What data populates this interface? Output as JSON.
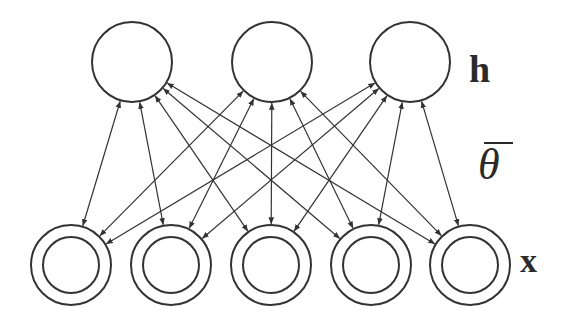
{
  "diagram": {
    "labels": {
      "hidden_layer": "h",
      "visible_layer": "x",
      "parameters": "θ"
    },
    "colors": {
      "stroke": "#333333",
      "background": "#ffffff"
    },
    "hidden_nodes": [
      {
        "id": "h1",
        "cx": 132,
        "cy": 62,
        "r": 40
      },
      {
        "id": "h2",
        "cx": 272,
        "cy": 62,
        "r": 40
      },
      {
        "id": "h3",
        "cx": 410,
        "cy": 62,
        "r": 40
      }
    ],
    "visible_nodes": [
      {
        "id": "x1",
        "cx": 71,
        "cy": 265,
        "r_outer": 40,
        "r_inner": 28
      },
      {
        "id": "x2",
        "cx": 171,
        "cy": 265,
        "r_outer": 40,
        "r_inner": 28
      },
      {
        "id": "x3",
        "cx": 271,
        "cy": 265,
        "r_outer": 40,
        "r_inner": 28
      },
      {
        "id": "x4",
        "cx": 371,
        "cy": 265,
        "r_outer": 40,
        "r_inner": 28
      },
      {
        "id": "x5",
        "cx": 470,
        "cy": 265,
        "r_outer": 40,
        "r_inner": 28
      }
    ],
    "edges": [
      {
        "from": "h1",
        "to": "x1",
        "type": "bidirectional"
      },
      {
        "from": "h1",
        "to": "x2",
        "type": "bidirectional"
      },
      {
        "from": "h1",
        "to": "x3",
        "type": "bidirectional"
      },
      {
        "from": "h1",
        "to": "x4",
        "type": "bidirectional"
      },
      {
        "from": "h1",
        "to": "x5",
        "type": "bidirectional"
      },
      {
        "from": "h2",
        "to": "x1",
        "type": "bidirectional"
      },
      {
        "from": "h2",
        "to": "x2",
        "type": "bidirectional"
      },
      {
        "from": "h2",
        "to": "x3",
        "type": "bidirectional"
      },
      {
        "from": "h2",
        "to": "x4",
        "type": "bidirectional"
      },
      {
        "from": "h2",
        "to": "x5",
        "type": "bidirectional"
      },
      {
        "from": "h3",
        "to": "x1",
        "type": "bidirectional"
      },
      {
        "from": "h3",
        "to": "x2",
        "type": "bidirectional"
      },
      {
        "from": "h3",
        "to": "x3",
        "type": "bidirectional"
      },
      {
        "from": "h3",
        "to": "x4",
        "type": "bidirectional"
      },
      {
        "from": "h3",
        "to": "x5",
        "type": "bidirectional"
      }
    ]
  }
}
